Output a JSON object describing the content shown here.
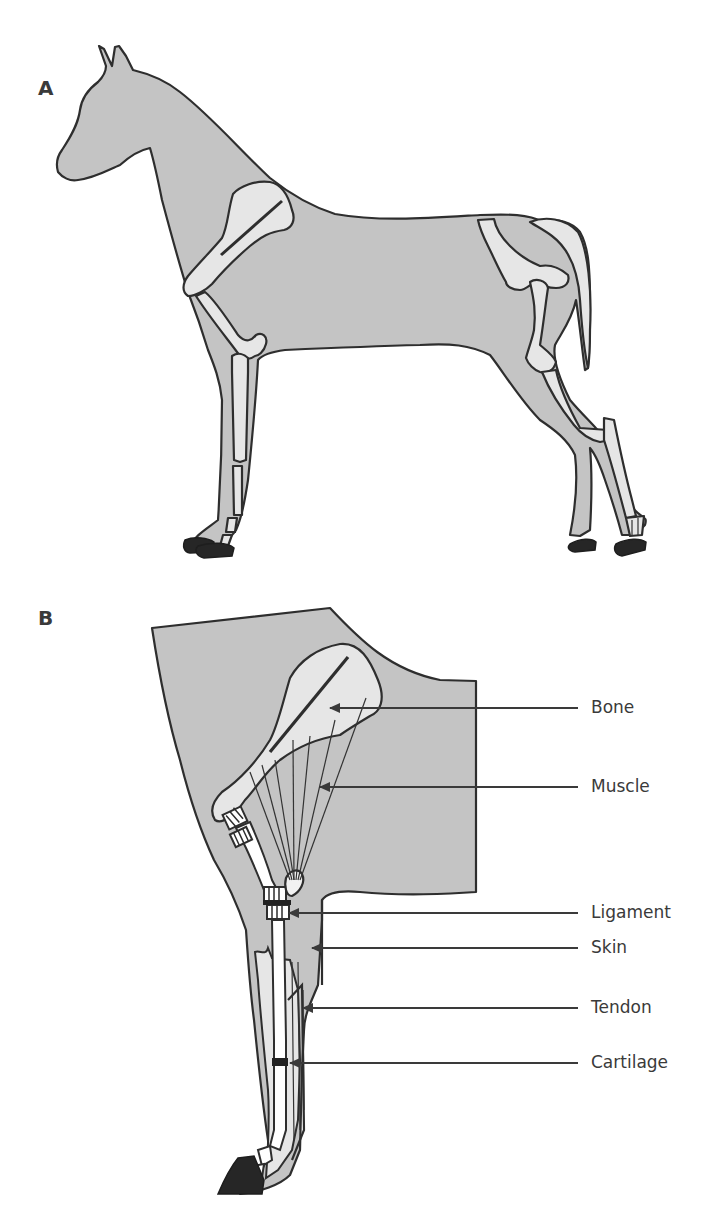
{
  "figure": {
    "panels": [
      {
        "id": "A",
        "label": "A",
        "subject": "horse-full-body-skeleton"
      },
      {
        "id": "B",
        "label": "B",
        "subject": "horse-forelimb-detail"
      }
    ],
    "panel_b_callouts": [
      {
        "label": "Bone"
      },
      {
        "label": "Muscle"
      },
      {
        "label": "Ligament"
      },
      {
        "label": "Skin"
      },
      {
        "label": "Tendon"
      },
      {
        "label": "Cartilage"
      }
    ],
    "colors": {
      "body_fill": "#c4c4c4",
      "bone_fill": "#e6e6e6",
      "outline": "#2e2e2e",
      "hoof": "#262626",
      "label_text": "#3a3a3a"
    }
  }
}
